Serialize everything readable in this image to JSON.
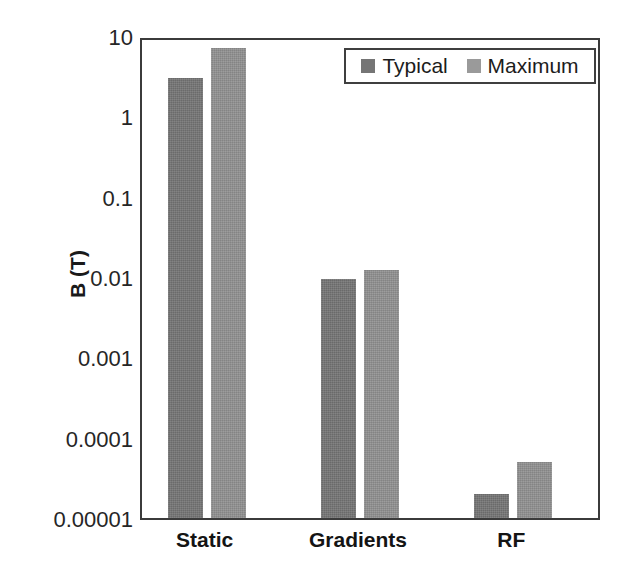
{
  "chart_data": {
    "type": "bar",
    "title": "",
    "subtitle": "",
    "xlabel": "",
    "ylabel": "B (T)",
    "yscale": "log",
    "ylim": [
      1e-05,
      10
    ],
    "grid": false,
    "legend_position": "top-right-inside",
    "categories": [
      "Static",
      "Gradients",
      "RF"
    ],
    "y_tick_labels": [
      "10",
      "1",
      "0.1",
      "0.01",
      "0.001",
      "0.0001",
      "0.00001"
    ],
    "y_tick_values": [
      10,
      1,
      0.1,
      0.01,
      0.001,
      0.0001,
      1e-05
    ],
    "series": [
      {
        "name": "Typical",
        "color": "#757575",
        "values": [
          3,
          0.0095,
          2e-05
        ]
      },
      {
        "name": "Maximum",
        "color": "#919191",
        "values": [
          7,
          0.0123,
          5e-05
        ]
      }
    ]
  },
  "axis": {
    "y_title": "B (T)"
  },
  "colors": {
    "typical": "#757575",
    "maximum": "#919191",
    "frame": "#3b3b3b",
    "text": "#1a1a1a",
    "background": "#ffffff"
  }
}
